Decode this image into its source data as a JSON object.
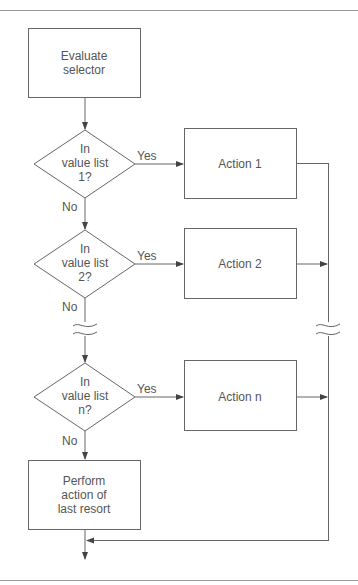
{
  "diagram": {
    "type": "flowchart",
    "colors": {
      "line": "#666666",
      "text": "#555555",
      "rule": "#888888",
      "background": "#ffffff"
    },
    "nodes": {
      "start": {
        "label_l1": "Evaluate",
        "label_l2": "selector"
      },
      "decision1": {
        "l1": "In",
        "l2": "value list",
        "l3": "1?"
      },
      "decision2": {
        "l1": "In",
        "l2": "value list",
        "l3": "2?"
      },
      "decisionN": {
        "l1": "In",
        "l2": "value list",
        "l3": "n?"
      },
      "action1": {
        "label": "Action 1"
      },
      "action2": {
        "label": "Action 2"
      },
      "actionN": {
        "label": "Action n"
      },
      "last": {
        "l1": "Perform",
        "l2": "action of",
        "l3": "last resort"
      }
    },
    "edges": {
      "yes1": "Yes",
      "no1": "No",
      "yes2": "Yes",
      "no2": "No",
      "yesN": "Yes",
      "noN": "No"
    }
  }
}
